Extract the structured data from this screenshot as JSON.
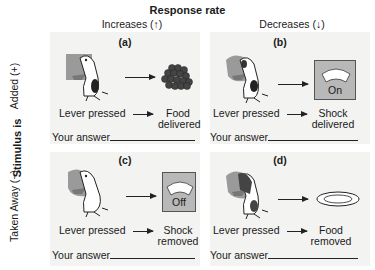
{
  "header": {
    "title": "Response rate",
    "columns": [
      {
        "label": "Increases (↑)"
      },
      {
        "label": "Decreases (↓)"
      }
    ]
  },
  "side": {
    "title": "Stimulus is",
    "rows": [
      {
        "label": "Added (+)"
      },
      {
        "label": "Taken Away (−)"
      }
    ]
  },
  "panels": [
    {
      "id": "(a)",
      "cause": "Lever pressed",
      "effect_line1": "Food",
      "effect_line2": "delivered",
      "answer_label": "Your answer",
      "stimulus": "food-pellets-icon"
    },
    {
      "id": "(b)",
      "cause": "Lever pressed",
      "effect_line1": "Shock",
      "effect_line2": "delivered",
      "answer_label": "Your answer",
      "stimulus": "shock-meter-icon",
      "meter_text": "On"
    },
    {
      "id": "(c)",
      "cause": "Lever pressed",
      "effect_line1": "Shock",
      "effect_line2": "removed",
      "answer_label": "Your answer",
      "stimulus": "shock-meter-icon",
      "meter_text": "Off"
    },
    {
      "id": "(d)",
      "cause": "Lever pressed",
      "effect_line1": "Food",
      "effect_line2": "removed",
      "answer_label": "Your answer",
      "stimulus": "empty-dish-icon"
    }
  ]
}
